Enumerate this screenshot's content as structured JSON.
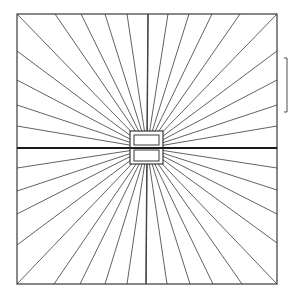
{
  "diagram": {
    "canvas": {
      "width": 289,
      "height": 297
    },
    "stroke_color": "#3a3a3a",
    "background": "#ffffff",
    "frame": {
      "x1": 17,
      "y1": 14,
      "x2": 277,
      "y2": 284
    },
    "center": {
      "x": 147,
      "y": 148
    },
    "edge_points": {
      "top_x": [
        17,
        55,
        81,
        105,
        127,
        148,
        168,
        189,
        212,
        240,
        277
      ],
      "bottom_x": [
        17,
        54,
        80,
        105,
        127,
        146,
        167,
        190,
        213,
        242,
        277
      ],
      "left_y": [
        51,
        80,
        105,
        126,
        148,
        168,
        191,
        214,
        245
      ],
      "right_y": [
        51,
        80,
        105,
        126,
        148,
        168,
        190,
        214,
        243
      ]
    },
    "central_box": {
      "outer": {
        "x": 130,
        "y": 131,
        "w": 33,
        "h": 33
      },
      "upper_inner": {
        "x": 134,
        "y": 135,
        "w": 25,
        "h": 10
      },
      "lower_inner": {
        "x": 134,
        "y": 150,
        "w": 25,
        "h": 11
      }
    },
    "scale_bracket": {
      "x": 287,
      "y1": 58,
      "y2": 112,
      "tick": 3
    }
  }
}
